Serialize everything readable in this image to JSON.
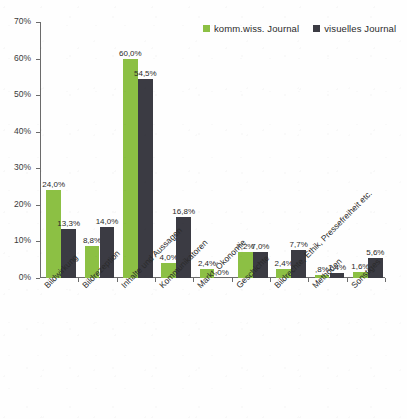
{
  "chart_data": {
    "type": "bar",
    "title": "",
    "subtitle": "",
    "xlabel": "",
    "ylabel": "",
    "ylim": [
      0,
      70
    ],
    "ytick_labels": [
      "0%",
      "10%",
      "20%",
      "30%",
      "40%",
      "50%",
      "60%",
      "70%"
    ],
    "ytick_values": [
      0,
      10,
      20,
      30,
      40,
      50,
      60,
      70
    ],
    "grid": false,
    "legend_position": "top-right",
    "categories": [
      "Bildwirkung",
      "Bildrezeption",
      "Inhalte und Aussagen",
      "Kommunikatoren",
      "Markt, Ökonomie",
      "Geschichte",
      "Bildrechte, Ethik, Pressefreiheit etc.",
      "Methoden",
      "Sonstiges"
    ],
    "series": [
      {
        "name": "komm.wiss. Journal",
        "color": "#8cc044",
        "values": [
          24.0,
          8.8,
          60.0,
          4.0,
          2.4,
          7.2,
          2.4,
          0.8,
          1.6
        ],
        "labels": [
          "24,0%",
          "8,8%",
          "60,0%",
          "4,0%",
          "2,4%",
          "7,2%",
          "2,4%",
          ",8%",
          "1,6%"
        ]
      },
      {
        "name": "visuelles Journal",
        "color": "#3b3b43",
        "values": [
          13.3,
          14.0,
          54.5,
          16.8,
          0.0,
          7.0,
          7.7,
          1.4,
          5.6
        ],
        "labels": [
          "13,3%",
          "14,0%",
          "54,5%",
          "16,8%",
          ",0%",
          "7,0%",
          "7,7%",
          "1,4%",
          "5,6%"
        ]
      }
    ]
  },
  "legend": {
    "entries": [
      {
        "label": "komm.wiss. Journal",
        "color": "#8cc044"
      },
      {
        "label": "visuelles Journal",
        "color": "#3b3b43"
      }
    ]
  }
}
